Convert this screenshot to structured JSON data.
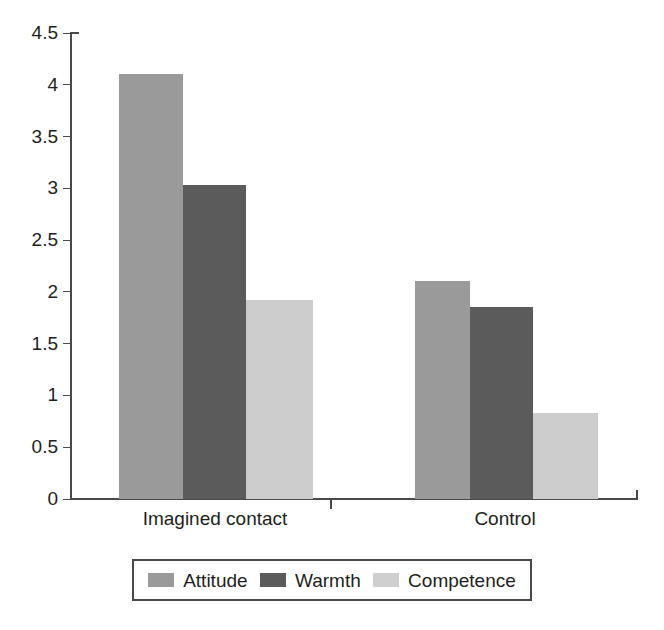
{
  "chart_data": {
    "type": "bar",
    "title": "",
    "xlabel": "",
    "ylabel": "",
    "categories": [
      "Imagined contact",
      "Control"
    ],
    "series": [
      {
        "name": "Attitude",
        "values": [
          4.1,
          2.11
        ],
        "color": "#9a9a9a"
      },
      {
        "name": "Warmth",
        "values": [
          3.03,
          1.85
        ],
        "color": "#5b5b5b"
      },
      {
        "name": "Competence",
        "values": [
          1.92,
          0.83
        ],
        "color": "#cccccc"
      }
    ],
    "ylim": [
      0,
      4.5
    ],
    "ytick_labels": [
      "0",
      "0.5",
      "1",
      "1.5",
      "2",
      "2.5",
      "3",
      "3.5",
      "4",
      "4.5"
    ],
    "ytick_values": [
      0,
      0.5,
      1,
      1.5,
      2,
      2.5,
      3,
      3.5,
      4,
      4.5
    ],
    "grid": false,
    "legend_position": "bottom"
  },
  "axis": {
    "y_ticks": [
      {
        "label": "4.5",
        "value": 4.5
      },
      {
        "label": "4",
        "value": 4
      },
      {
        "label": "3.5",
        "value": 3.5
      },
      {
        "label": "3",
        "value": 3
      },
      {
        "label": "2.5",
        "value": 2.5
      },
      {
        "label": "2",
        "value": 2
      },
      {
        "label": "1.5",
        "value": 1.5
      },
      {
        "label": "1",
        "value": 1
      },
      {
        "label": "0.5",
        "value": 0.5
      },
      {
        "label": "0",
        "value": 0
      }
    ]
  },
  "legend": {
    "items": [
      {
        "label": "Attitude",
        "color": "#9a9a9a"
      },
      {
        "label": "Warmth",
        "color": "#5b5b5b"
      },
      {
        "label": "Competence",
        "color": "#cfcfcf"
      }
    ]
  }
}
